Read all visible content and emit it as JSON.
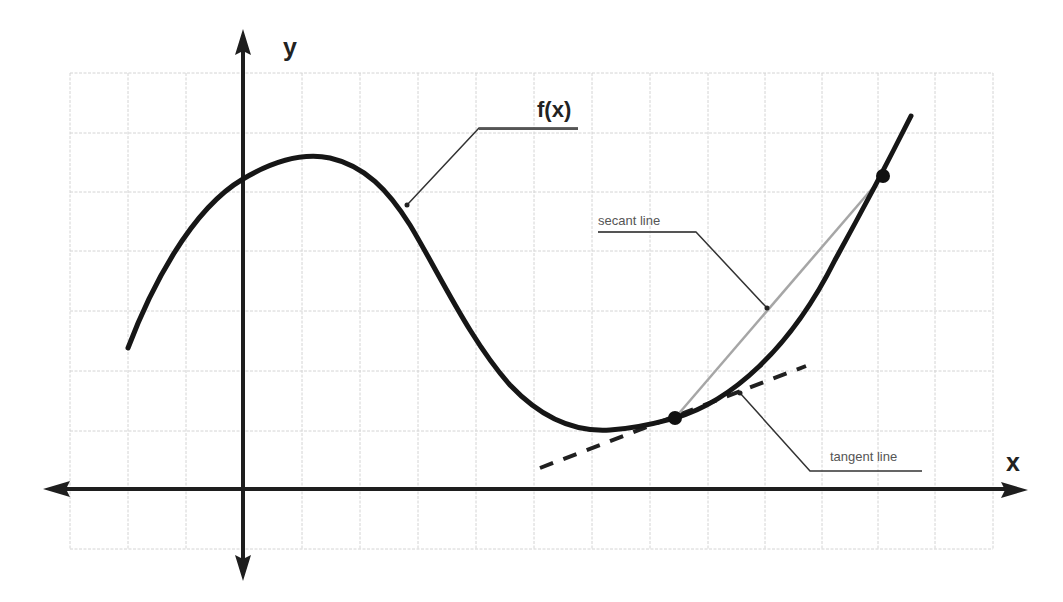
{
  "diagram": {
    "axes": {
      "x_label": "x",
      "y_label": "y"
    },
    "labels": {
      "function": "f(x)",
      "secant": "secant line",
      "tangent": "tangent line"
    },
    "colors": {
      "curve": "#161616",
      "axis": "#1e1e1e",
      "secant": "#a6a6a6",
      "tangent": "#202020",
      "grid": "#d4d4d4",
      "label_text": "#555555"
    },
    "grid": {
      "columns": 16,
      "rows": 8
    },
    "points": [
      {
        "name": "tangent-point",
        "role": "point of tangency / secant start"
      },
      {
        "name": "secant-end-point",
        "role": "second secant point"
      }
    ]
  }
}
